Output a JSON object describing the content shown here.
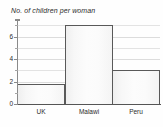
{
  "chart_data": {
    "type": "bar",
    "title": "No. of children per woman",
    "xlabel": "",
    "ylabel": "",
    "categories": [
      "UK",
      "Malawi",
      "Peru"
    ],
    "values": [
      1.8,
      7,
      3
    ],
    "ylim": [
      0,
      7.3
    ],
    "yticks": [
      0,
      2,
      4,
      6
    ],
    "ytick_labels": [
      "0",
      "2",
      "4",
      "6"
    ],
    "gridlines": [
      1,
      2,
      3,
      4,
      5,
      6,
      7
    ],
    "grid": true,
    "legend": null,
    "colors": {
      "bar_fill": "#fafafa",
      "bar_border": "#595959",
      "gridline": "#e3e3e3",
      "axis": "#8a8a8a",
      "text": "#2b2b2b",
      "background": "#fefefe"
    }
  }
}
